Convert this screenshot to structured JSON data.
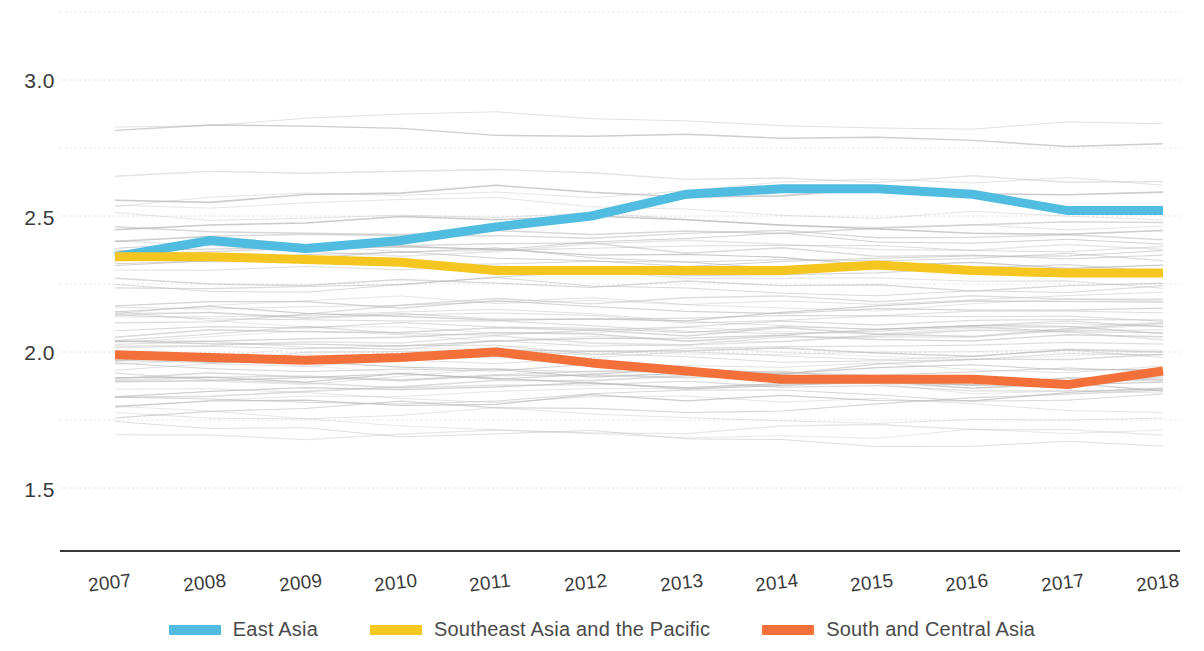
{
  "chart_data": {
    "type": "line",
    "title": "",
    "subtitle": "",
    "xlabel": "",
    "ylabel": "",
    "grid": true,
    "legend_position": "bottom",
    "x": [
      2007,
      2008,
      2009,
      2010,
      2011,
      2012,
      2013,
      2014,
      2015,
      2016,
      2017,
      2018
    ],
    "xtick_labels": [
      "2007",
      "2008",
      "2009",
      "2010",
      "2011",
      "2012",
      "2013",
      "2014",
      "2015",
      "2016",
      "2017",
      "2018"
    ],
    "ytick_labels": [
      "3.0",
      "2.5",
      "2.0",
      "1.5"
    ],
    "ytick_values": [
      3.0,
      2.5,
      2.0,
      1.5
    ],
    "minor_gridlines": [
      3.25,
      2.75,
      2.25,
      1.75
    ],
    "ylim": [
      1.38,
      3.3
    ],
    "xlim": [
      2007,
      2018
    ],
    "series": [
      {
        "name": "East Asia",
        "color": "#4FBCE0",
        "values": [
          2.35,
          2.41,
          2.38,
          2.41,
          2.46,
          2.5,
          2.58,
          2.6,
          2.6,
          2.58,
          2.52,
          2.52
        ]
      },
      {
        "name": "Southeast Asia and the Pacific",
        "color": "#F5C520",
        "values": [
          2.35,
          2.35,
          2.34,
          2.33,
          2.3,
          2.3,
          2.3,
          2.3,
          2.32,
          2.3,
          2.29,
          2.29
        ]
      },
      {
        "name": "South and Central Asia",
        "color": "#F4703A",
        "values": [
          1.99,
          1.98,
          1.97,
          1.98,
          2.0,
          1.96,
          1.93,
          1.9,
          1.9,
          1.9,
          1.88,
          1.93
        ]
      }
    ],
    "background_series_note": "faint grey individual-country lines",
    "background_color": "#b8b8b8"
  },
  "legend": {
    "items": [
      {
        "label": "East Asia",
        "color": "#4FBCE0"
      },
      {
        "label": "Southeast Asia and the Pacific",
        "color": "#F5C520"
      },
      {
        "label": "South and Central Asia",
        "color": "#F4703A"
      }
    ]
  }
}
